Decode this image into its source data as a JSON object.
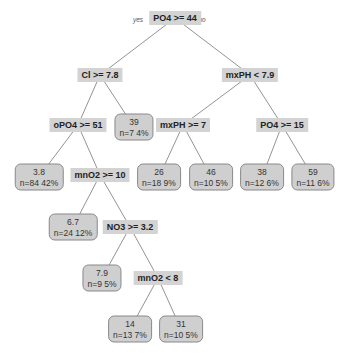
{
  "tree": {
    "branch_labels": {
      "yes": "yes",
      "no": "no"
    },
    "splits": [
      {
        "id": "root",
        "label": "PO4 >= 44",
        "x": 175,
        "y": 18
      },
      {
        "id": "s_cl",
        "label": "Cl >= 7.8",
        "x": 100,
        "y": 75
      },
      {
        "id": "s_mxph1",
        "label": "mxPH < 7.9",
        "x": 250,
        "y": 75
      },
      {
        "id": "s_opo4",
        "label": "oPO4 >= 51",
        "x": 78,
        "y": 125
      },
      {
        "id": "s_mxph2",
        "label": "mxPH >= 7",
        "x": 183,
        "y": 125
      },
      {
        "id": "s_po4b",
        "label": "PO4 >= 15",
        "x": 282,
        "y": 125
      },
      {
        "id": "s_mno2a",
        "label": "mnO2 >= 10",
        "x": 100,
        "y": 175
      },
      {
        "id": "s_no3",
        "label": "NO3 >= 3.2",
        "x": 130,
        "y": 227
      },
      {
        "id": "s_mno2b",
        "label": "mnO2 < 8",
        "x": 158,
        "y": 278
      }
    ],
    "leaves": [
      {
        "id": "l1",
        "value": "3.8",
        "info": "n=84  42%",
        "x": 39,
        "y": 177
      },
      {
        "id": "l2",
        "value": "39",
        "info": "n=7  4%",
        "x": 134,
        "y": 127
      },
      {
        "id": "l3",
        "value": "6.7",
        "info": "n=24  12%",
        "x": 73,
        "y": 227
      },
      {
        "id": "l4",
        "value": "26",
        "info": "n=18  9%",
        "x": 159,
        "y": 177
      },
      {
        "id": "l5",
        "value": "46",
        "info": "n=10  5%",
        "x": 211,
        "y": 177
      },
      {
        "id": "l6",
        "value": "38",
        "info": "n=12  6%",
        "x": 262,
        "y": 177
      },
      {
        "id": "l7",
        "value": "59",
        "info": "n=11  6%",
        "x": 313,
        "y": 177
      },
      {
        "id": "l8",
        "value": "7.9",
        "info": "n=9  5%",
        "x": 102,
        "y": 278
      },
      {
        "id": "l9",
        "value": "14",
        "info": "n=13  7%",
        "x": 130,
        "y": 329
      },
      {
        "id": "l10",
        "value": "31",
        "info": "n=10  5%",
        "x": 181,
        "y": 329
      }
    ],
    "edges": [
      [
        "root",
        "s_cl"
      ],
      [
        "root",
        "s_mxph1"
      ],
      [
        "s_cl",
        "s_opo4"
      ],
      [
        "s_cl",
        "l2"
      ],
      [
        "s_mxph1",
        "s_mxph2"
      ],
      [
        "s_mxph1",
        "s_po4b"
      ],
      [
        "s_opo4",
        "l1"
      ],
      [
        "s_opo4",
        "s_mno2a"
      ],
      [
        "s_mxph2",
        "l4"
      ],
      [
        "s_mxph2",
        "l5"
      ],
      [
        "s_po4b",
        "l6"
      ],
      [
        "s_po4b",
        "l7"
      ],
      [
        "s_mno2a",
        "l3"
      ],
      [
        "s_mno2a",
        "s_no3"
      ],
      [
        "s_no3",
        "l8"
      ],
      [
        "s_no3",
        "s_mno2b"
      ],
      [
        "s_mno2b",
        "l9"
      ],
      [
        "s_mno2b",
        "l10"
      ]
    ]
  }
}
